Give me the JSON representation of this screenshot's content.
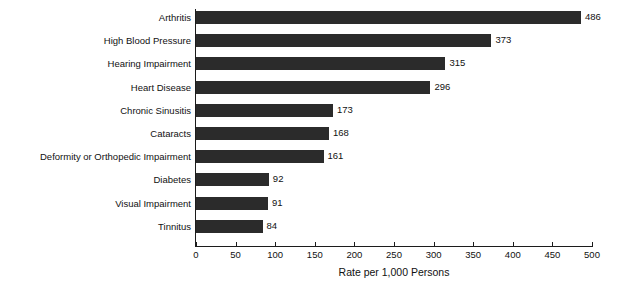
{
  "chart_data": {
    "type": "bar",
    "orientation": "horizontal",
    "title": "",
    "xlabel": "Rate per 1,000 Persons",
    "ylabel": "",
    "categories": [
      "Arthritis",
      "High Blood Pressure",
      "Hearing Impairment",
      "Heart Disease",
      "Chronic Sinusitis",
      "Cataracts",
      "Deformity or Orthopedic Impairment",
      "Diabetes",
      "Visual Impairment",
      "Tinnitus"
    ],
    "values": [
      486,
      373,
      315,
      296,
      173,
      168,
      161,
      92,
      91,
      84
    ],
    "value_labels": [
      "486",
      "373",
      "315",
      "296",
      "173",
      "168",
      "161",
      "92",
      "91",
      "84"
    ],
    "xlim": [
      0,
      500
    ],
    "xticks": [
      0,
      50,
      100,
      150,
      200,
      250,
      300,
      350,
      400,
      450,
      500
    ],
    "xtick_labels": [
      "0",
      "50",
      "100",
      "150",
      "200",
      "250",
      "300",
      "350",
      "400",
      "450",
      "500"
    ],
    "grid": false,
    "legend": false,
    "bar_color": "#2b2b2b",
    "axis_color": "#1c1c1c",
    "background": "#ffffff"
  }
}
